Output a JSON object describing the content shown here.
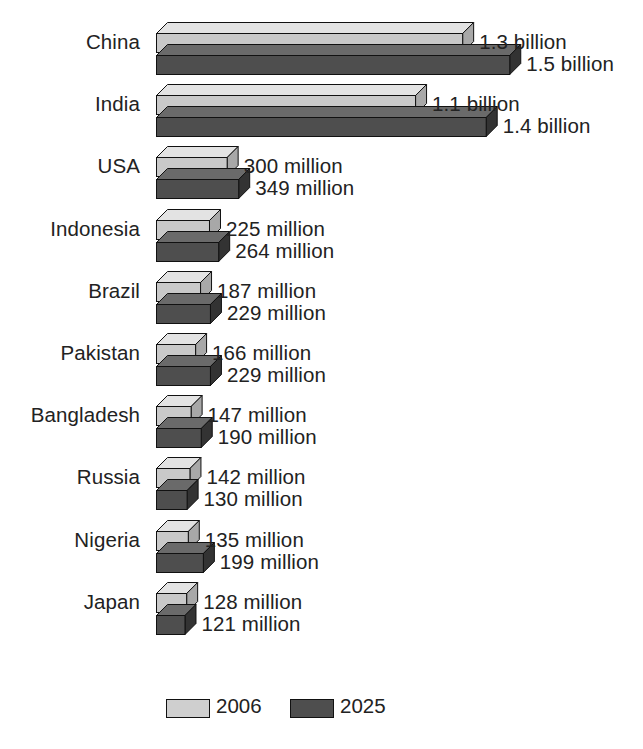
{
  "chart_data": {
    "type": "bar",
    "orientation": "horizontal",
    "title": "",
    "xlabel": "",
    "ylabel": "",
    "grid": false,
    "legend_position": "bottom",
    "categories": [
      "China",
      "India",
      "USA",
      "Indonesia",
      "Brazil",
      "Pakistan",
      "Bangladesh",
      "Russia",
      "Nigeria",
      "Japan"
    ],
    "series": [
      {
        "name": "2006",
        "color": "#c9c9c9",
        "values": [
          1300,
          1100,
          300,
          225,
          187,
          166,
          147,
          142,
          135,
          128
        ],
        "labels": [
          "1.3 billion",
          "1.1 billion",
          "300 million",
          "225 million",
          "187 million",
          "166 million",
          "147 million",
          "142 million",
          "135 million",
          "128 million"
        ]
      },
      {
        "name": "2025",
        "color": "#4e4e4e",
        "values": [
          1500,
          1400,
          349,
          264,
          229,
          229,
          190,
          130,
          199,
          121
        ],
        "labels": [
          "1.5 billion",
          "1.4 billion",
          "349 million",
          "264 million",
          "229 million",
          "229 million",
          "190 million",
          "130 million",
          "199 million",
          "121 million"
        ]
      }
    ],
    "units": "millions of people",
    "xlim": [
      0,
      1500
    ]
  },
  "legend": {
    "items": [
      {
        "label": "2006",
        "color": "#cfcfcf",
        "swatch": "legend-swatch-2006"
      },
      {
        "label": "2025",
        "color": "#4e4e4e",
        "swatch": "legend-swatch-2025"
      }
    ]
  }
}
